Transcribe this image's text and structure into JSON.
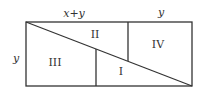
{
  "diagram": {
    "labels": {
      "top_left": "x+y",
      "top_right": "y",
      "left_side": "y"
    },
    "regions": {
      "r1": "I",
      "r2": "II",
      "r3": "III",
      "r4": "IV"
    },
    "stroke_color": "#333333"
  }
}
